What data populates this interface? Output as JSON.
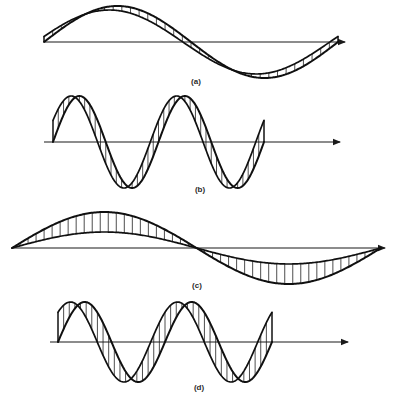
{
  "figure": {
    "title": "",
    "background_color": "#ffffff",
    "ink_color": "#101010",
    "hatch_color": "#3a3a3a",
    "axis_color": "#1a1a1a",
    "width": 399,
    "height": 399
  },
  "panels": [
    {
      "id": "a",
      "label": "(a)",
      "label_x": 196,
      "label_y": 84,
      "description": "two in-phase sinusoids of nearly equal amplitude forming a narrow hatched band",
      "axis": {
        "x1": 44,
        "x2": 345,
        "y": 42,
        "arrow": true
      },
      "curves": [
        {
          "name": "wave-1",
          "amplitude": 36,
          "phase_deg": 0,
          "cycles": 1,
          "x_start": 44,
          "x_end": 338,
          "baseline": 42
        },
        {
          "name": "wave-2",
          "amplitude": 32,
          "phase_deg": 10,
          "cycles": 1,
          "x_start": 44,
          "x_end": 338,
          "baseline": 42
        }
      ],
      "hatch": {
        "count": 34,
        "orientation": "vertical"
      }
    },
    {
      "id": "b",
      "label": "(b)",
      "label_x": 200,
      "label_y": 192,
      "description": "two sinusoids of equal amplitude with a small phase difference, two cycles",
      "axis": {
        "x1": 44,
        "x2": 340,
        "y": 142,
        "arrow": true
      },
      "curves": [
        {
          "name": "wave-1",
          "amplitude": 46,
          "phase_deg": 0,
          "cycles": 2,
          "x_start": 53,
          "x_end": 264,
          "baseline": 142
        },
        {
          "name": "wave-2",
          "amplitude": 46,
          "phase_deg": 28,
          "cycles": 2,
          "x_start": 53,
          "x_end": 264,
          "baseline": 142
        }
      ],
      "hatch": {
        "count": 40,
        "orientation": "vertical"
      }
    },
    {
      "id": "c",
      "label": "(c)",
      "label_x": 197,
      "label_y": 288,
      "description": "two in-phase sinusoids of very different amplitude, one cycle, wide hatched region",
      "axis": {
        "x1": 12,
        "x2": 385,
        "y": 248,
        "arrow": true
      },
      "curves": [
        {
          "name": "wave-1",
          "amplitude": 36,
          "phase_deg": 0,
          "cycles": 1,
          "x_start": 12,
          "x_end": 381,
          "baseline": 248
        },
        {
          "name": "wave-2",
          "amplitude": 16,
          "phase_deg": 0,
          "cycles": 1,
          "x_start": 12,
          "x_end": 381,
          "baseline": 248
        }
      ],
      "hatch": {
        "count": 46,
        "orientation": "vertical"
      }
    },
    {
      "id": "d",
      "label": "(d)",
      "label_x": 199,
      "label_y": 390,
      "description": "two sinusoids of equal amplitude with a larger phase difference, two cycles",
      "axis": {
        "x1": 50,
        "x2": 348,
        "y": 342,
        "arrow": true
      },
      "curves": [
        {
          "name": "wave-1",
          "amplitude": 40,
          "phase_deg": 0,
          "cycles": 2,
          "x_start": 58,
          "x_end": 272,
          "baseline": 342
        },
        {
          "name": "wave-2",
          "amplitude": 40,
          "phase_deg": 48,
          "cycles": 2,
          "x_start": 58,
          "x_end": 272,
          "baseline": 342
        }
      ],
      "hatch": {
        "count": 38,
        "orientation": "vertical"
      }
    }
  ],
  "chart_data": {
    "type": "line",
    "title": "",
    "xlabel": "",
    "ylabel": "",
    "grid": false,
    "legend": "none",
    "panel_ids": [
      "a",
      "b",
      "c",
      "d"
    ],
    "panel_labels": [
      "(a)",
      "(b)",
      "(c)",
      "(d)"
    ],
    "series": [
      {
        "name": "a-wave-1",
        "panel": "a",
        "waveform": "sine",
        "amplitude": 36,
        "phase_deg": 0,
        "cycles": 1
      },
      {
        "name": "a-wave-2",
        "panel": "a",
        "waveform": "sine",
        "amplitude": 32,
        "phase_deg": 10,
        "cycles": 1
      },
      {
        "name": "b-wave-1",
        "panel": "b",
        "waveform": "sine",
        "amplitude": 46,
        "phase_deg": 0,
        "cycles": 2
      },
      {
        "name": "b-wave-2",
        "panel": "b",
        "waveform": "sine",
        "amplitude": 46,
        "phase_deg": 28,
        "cycles": 2
      },
      {
        "name": "c-wave-1",
        "panel": "c",
        "waveform": "sine",
        "amplitude": 36,
        "phase_deg": 0,
        "cycles": 1
      },
      {
        "name": "c-wave-2",
        "panel": "c",
        "waveform": "sine",
        "amplitude": 16,
        "phase_deg": 0,
        "cycles": 1
      },
      {
        "name": "d-wave-1",
        "panel": "d",
        "waveform": "sine",
        "amplitude": 40,
        "phase_deg": 0,
        "cycles": 2
      },
      {
        "name": "d-wave-2",
        "panel": "d",
        "waveform": "sine",
        "amplitude": 40,
        "phase_deg": 48,
        "cycles": 2
      }
    ]
  }
}
